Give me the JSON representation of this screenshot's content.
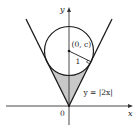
{
  "diagram": {
    "axes": {
      "x_label": "x",
      "y_label": "y",
      "origin_label": "0"
    },
    "curve_label": "y = |2x|",
    "center_label": "(0, c)",
    "radius_label": "1",
    "colors": {
      "line": "#1a1a1a",
      "axis": "#333333",
      "shade": "#c8c8c8"
    }
  }
}
